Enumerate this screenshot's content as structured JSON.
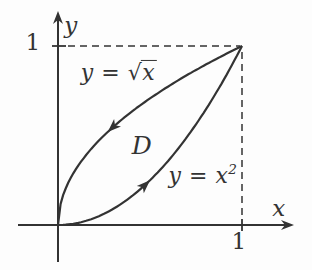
{
  "figure": {
    "background": "#fdfdfd",
    "ink": "#333333",
    "axes": {
      "x_label": "x",
      "y_label": "y",
      "x_tick": "1",
      "y_tick": "1"
    },
    "region": {
      "label": "D"
    },
    "curves": [
      {
        "id": "curve-y-sqrt-x",
        "shape": "sqrt",
        "label": {
          "head": "y = ",
          "radical": "√",
          "radicand": "x"
        },
        "arrow_direction": "toward-origin"
      },
      {
        "id": "curve-y-x-squared",
        "shape": "square",
        "label": {
          "base": "y = x",
          "exponent": "2"
        },
        "arrow_direction": "toward-corner"
      }
    ]
  }
}
